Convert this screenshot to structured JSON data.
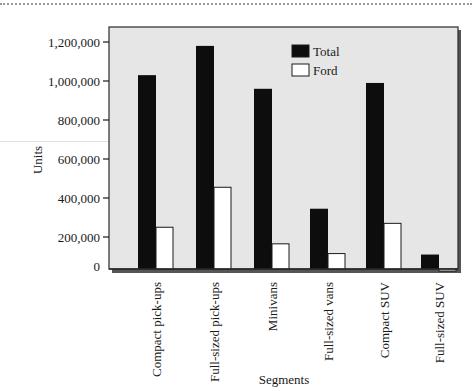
{
  "chart_data": {
    "type": "bar",
    "title": "",
    "xlabel": "Segments",
    "ylabel": "Units",
    "ylim": [
      0,
      1200000
    ],
    "yticks": [
      0,
      200000,
      400000,
      600000,
      800000,
      1000000,
      1200000
    ],
    "ytick_labels": [
      "0",
      "200,000",
      "400,000",
      "600,000",
      "800,000",
      "1,000,000",
      "1,200,000"
    ],
    "grid": false,
    "legend_position": "upper-center-right",
    "categories": [
      "Compact pick-ups",
      "Full-sized pick-ups",
      "Minivans",
      "Full-sized vans",
      "Compact SUV",
      "Full-sized SUV"
    ],
    "series": [
      {
        "name": "Total",
        "color": "#0d0d0d",
        "values": [
          1030000,
          1180000,
          960000,
          345000,
          990000,
          110000
        ]
      },
      {
        "name": "Ford",
        "color": "#ffffff",
        "values": [
          250000,
          455000,
          165000,
          115000,
          270000,
          25000
        ]
      }
    ]
  },
  "colors": {
    "plot_background": "#e6e6e6",
    "frame": "#2a2a2a",
    "shadow": "#555555"
  }
}
